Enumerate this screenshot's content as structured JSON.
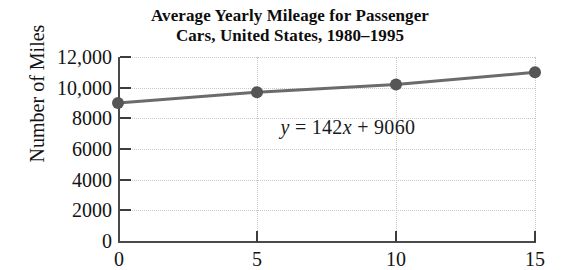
{
  "chart_data": {
    "type": "line",
    "title": "Average Yearly Mileage for Passenger Cars, United States, 1980–1995",
    "title_lines": [
      "Average Yearly Mileage for Passenger",
      "Cars, United States, 1980–1995"
    ],
    "xlabel": "",
    "ylabel": "Number of Miles",
    "x": [
      0,
      5,
      10,
      15
    ],
    "values": [
      9000,
      9700,
      10200,
      11000
    ],
    "series": [
      {
        "name": "Average yearly mileage",
        "x": [
          0,
          5,
          10,
          15
        ],
        "values": [
          9000,
          9700,
          10200,
          11000
        ]
      }
    ],
    "xlim": [
      0,
      15
    ],
    "ylim": [
      0,
      12000
    ],
    "xticks": [
      0,
      5,
      10,
      15
    ],
    "xtick_labels": [
      "0",
      "5",
      "10",
      "15"
    ],
    "yticks": [
      0,
      2000,
      4000,
      6000,
      8000,
      10000,
      12000
    ],
    "ytick_labels": [
      "0",
      "2000",
      "4000",
      "6000",
      "8000",
      "10,000",
      "12,000"
    ],
    "grid": true,
    "legend": null,
    "annotations": [
      {
        "name": "regression-equation",
        "text": "y = 142x + 9060",
        "parts": {
          "lhs": "y",
          "eq": "=",
          "slope": "142",
          "var": "x",
          "plus": "+",
          "intercept": "9060"
        },
        "x_data": 8.0,
        "y_data": 10100
      }
    ],
    "colors": {
      "line": "#6b6b6b",
      "marker": "#565656",
      "axis": "#4a4a4a",
      "grid": "#c9c9c9",
      "text": "#131313",
      "background": "#ffffff"
    }
  }
}
